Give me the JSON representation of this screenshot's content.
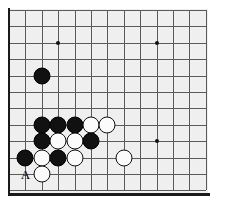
{
  "figure": {
    "kind": "go-board-diagram",
    "background_color": "#ffffff",
    "board_color": "#efefef",
    "line_color": "#5a5a5a",
    "edge_color": "#1a1a1a",
    "black_stone_color": "#111111",
    "white_stone_color": "#fbfbfb"
  },
  "board": {
    "origin_x": 9,
    "origin_y": 10,
    "cell": 16.4,
    "cols": 12,
    "rows": 11,
    "has_left_edge": true,
    "has_bottom_edge": true,
    "star_points": [
      {
        "col": 3,
        "row": 2
      },
      {
        "col": 9,
        "row": 2
      },
      {
        "col": 9,
        "row": 8
      }
    ],
    "stones": [
      {
        "color": "black",
        "col": 2,
        "row": 4
      },
      {
        "color": "black",
        "col": 2,
        "row": 7
      },
      {
        "color": "black",
        "col": 3,
        "row": 7
      },
      {
        "color": "black",
        "col": 4,
        "row": 7
      },
      {
        "color": "white",
        "col": 5,
        "row": 7
      },
      {
        "color": "white",
        "col": 6,
        "row": 7
      },
      {
        "color": "black",
        "col": 2,
        "row": 8
      },
      {
        "color": "white",
        "col": 3,
        "row": 8
      },
      {
        "color": "white",
        "col": 4,
        "row": 8
      },
      {
        "color": "black",
        "col": 5,
        "row": 8
      },
      {
        "color": "black",
        "col": 1,
        "row": 9
      },
      {
        "color": "white",
        "col": 2,
        "row": 9
      },
      {
        "color": "black",
        "col": 3,
        "row": 9
      },
      {
        "color": "white",
        "col": 4,
        "row": 9
      },
      {
        "color": "white",
        "col": 7,
        "row": 9
      },
      {
        "color": "white",
        "col": 2,
        "row": 10
      }
    ],
    "labels": [
      {
        "text": "A",
        "col": 1,
        "row": 10
      }
    ]
  }
}
